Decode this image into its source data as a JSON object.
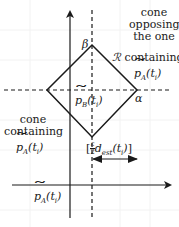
{
  "diagram": {
    "axes": {
      "x_axis": {
        "y": 185,
        "x_from": 12,
        "x_to": 172
      },
      "y_axis": {
        "x": 70,
        "y_from": 218,
        "y_to": 10
      }
    },
    "dashed_lines": {
      "vertical_x": 92,
      "horizontal_y": 90
    },
    "rhombus": {
      "name": "R",
      "top": [
        92,
        45
      ],
      "right": [
        137,
        90
      ],
      "bottom": [
        92,
        137
      ],
      "left": [
        47,
        90
      ]
    },
    "labels": {
      "top_vertex": "β",
      "right_vertex": "α",
      "region": "ℛ",
      "center_point_base": "p",
      "center_point_sub": "B",
      "center_point_arg": "(t",
      "center_point_arg_sub": "i",
      "center_point_close": ")",
      "right_cone_line1": "cone",
      "right_cone_line2": "opposing",
      "right_cone_line3": "the one",
      "right_cone_line4": "containing",
      "left_cone_line1": "cone",
      "left_cone_line2": "containing",
      "pA_base": "p",
      "pA_sub": "A",
      "pA_arg": "(t",
      "pA_arg_sub": "i",
      "pA_close": ")",
      "distance_frac_num": "ε",
      "distance_frac_den": "2",
      "distance_d": "d",
      "distance_sub": "est",
      "distance_arg": "(t",
      "distance_arg_sub": "i",
      "distance_close": ")"
    },
    "colors": {
      "line": "#1a1a1a",
      "background": "#ffffff",
      "grid": "#f0f0f0"
    }
  }
}
